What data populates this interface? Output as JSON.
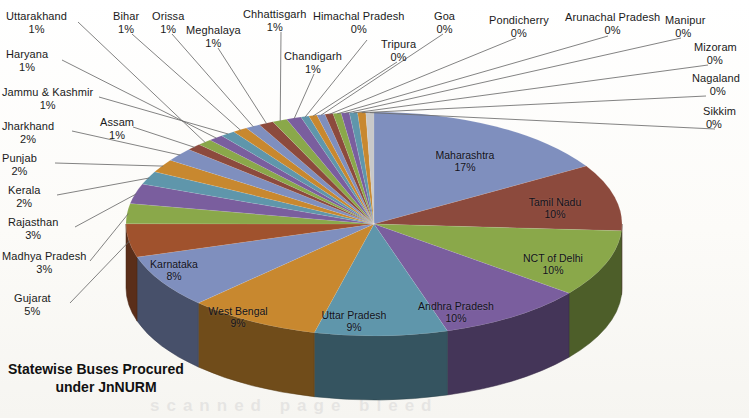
{
  "title": {
    "line1": "Statewise Buses Procured",
    "line2": "under JnNURM",
    "full": "Statewise Buses Procured under JnNURM"
  },
  "bleed_text": "scanned page bleed",
  "chart_data": {
    "type": "pie",
    "title": "Statewise Buses Procured under JnNURM",
    "subtitle": "",
    "xlabel": "",
    "ylabel": "",
    "three_d": true,
    "start_angle_deg": 0,
    "direction": "clockwise",
    "legend": "none",
    "grid": false,
    "value_unit": "percent",
    "categories": [
      "Maharashtra",
      "Tamil Nadu",
      "NCT of Delhi",
      "Andhra Pradesh",
      "Uttar Pradesh",
      "West Bengal",
      "Karnataka",
      "Gujarat",
      "Madhya Pradesh",
      "Rajasthan",
      "Kerala",
      "Punjab",
      "Jharkhand",
      "Assam",
      "Uttarakhand",
      "Haryana",
      "Jammu & Kashmir",
      "Bihar",
      "Orissa",
      "Meghalaya",
      "Chhattisgarh",
      "Chandigarh",
      "Himachal Pradesh",
      "Tripura",
      "Goa",
      "Pondicherry",
      "Arunachal Pradesh",
      "Manipur",
      "Mizoram",
      "Nagaland",
      "Sikkim"
    ],
    "values": [
      17,
      10,
      10,
      10,
      9,
      9,
      8,
      5,
      3,
      3,
      2,
      2,
      2,
      1,
      1,
      1,
      1,
      1,
      1,
      1,
      1,
      1,
      0,
      0,
      0,
      0,
      0,
      0,
      0,
      0,
      0
    ],
    "labels": [
      "17%",
      "10%",
      "10%",
      "10%",
      "9%",
      "9%",
      "8%",
      "5%",
      "3%",
      "3%",
      "2%",
      "2%",
      "2%",
      "1%",
      "1%",
      "1%",
      "1%",
      "1%",
      "1%",
      "1%",
      "1%",
      "1%",
      "0%",
      "0%",
      "0%",
      "0%",
      "0%",
      "0%",
      "0%",
      "0%",
      "0%"
    ],
    "colors": [
      "#7f8fbe",
      "#8c4a3d",
      "#8aa84a",
      "#7a5e9e",
      "#5f96ab",
      "#c8882f",
      "#7f8fbe",
      "#a0522d",
      "#8aa84a",
      "#7a5e9e",
      "#5f96ab",
      "#c8882f",
      "#7f8fbe",
      "#8c4a3d",
      "#8aa84a",
      "#7a5e9e",
      "#5f96ab",
      "#c8882f",
      "#7f8fbe",
      "#8c4a3d",
      "#8aa84a",
      "#7a5e9e",
      "#5f96ab",
      "#c8882f",
      "#7f8fbe",
      "#8c4a3d",
      "#8aa84a",
      "#7a5e9e",
      "#5f96ab",
      "#c8882f",
      "#c9c9c9"
    ]
  },
  "slices": {
    "maharashtra": {
      "name": "Maharashtra",
      "pct": "17%"
    },
    "tamil_nadu": {
      "name": "Tamil Nadu",
      "pct": "10%"
    },
    "nct_of_delhi": {
      "name": "NCT of Delhi",
      "pct": "10%"
    },
    "andhra_pradesh": {
      "name": "Andhra Pradesh",
      "pct": "10%"
    },
    "uttar_pradesh": {
      "name": "Uttar Pradesh",
      "pct": "9%"
    },
    "west_bengal": {
      "name": "West Bengal",
      "pct": "9%"
    },
    "karnataka": {
      "name": "Karnataka",
      "pct": "8%"
    },
    "gujarat": {
      "name": "Gujarat",
      "pct": "5%"
    },
    "madhya_pradesh": {
      "name": "Madhya Pradesh",
      "pct": "3%"
    },
    "rajasthan": {
      "name": "Rajasthan",
      "pct": "3%"
    },
    "kerala": {
      "name": "Kerala",
      "pct": "2%"
    },
    "punjab": {
      "name": "Punjab",
      "pct": "2%"
    },
    "jharkhand": {
      "name": "Jharkhand",
      "pct": "2%"
    },
    "assam": {
      "name": "Assam",
      "pct": "1%"
    },
    "uttarakhand": {
      "name": "Uttarakhand",
      "pct": "1%"
    },
    "haryana": {
      "name": "Haryana",
      "pct": "1%"
    },
    "jammu_kashmir": {
      "name": "Jammu & Kashmir",
      "pct": "1%"
    },
    "bihar": {
      "name": "Bihar",
      "pct": "1%"
    },
    "orissa": {
      "name": "Orissa",
      "pct": "1%"
    },
    "meghalaya": {
      "name": "Meghalaya",
      "pct": "1%"
    },
    "chhattisgarh": {
      "name": "Chhattisgarh",
      "pct": "1%"
    },
    "chandigarh": {
      "name": "Chandigarh",
      "pct": "1%"
    },
    "himachal_pradesh": {
      "name": "Himachal Pradesh",
      "pct": "0%"
    },
    "tripura": {
      "name": "Tripura",
      "pct": "0%"
    },
    "goa": {
      "name": "Goa",
      "pct": "0%"
    },
    "pondicherry": {
      "name": "Pondicherry",
      "pct": "0%"
    },
    "arunachal_pradesh": {
      "name": "Arunachal Pradesh",
      "pct": "0%"
    },
    "manipur": {
      "name": "Manipur",
      "pct": "0%"
    },
    "mizoram": {
      "name": "Mizoram",
      "pct": "0%"
    },
    "nagaland": {
      "name": "Nagaland",
      "pct": "0%"
    },
    "sikkim": {
      "name": "Sikkim",
      "pct": "0%"
    }
  }
}
